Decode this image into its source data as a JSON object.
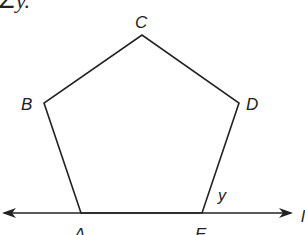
{
  "caption_fragment": "∠y.",
  "figure": {
    "type": "regular pentagon on a line",
    "vertices": {
      "A": {
        "label": "A",
        "x": 81,
        "y": 213
      },
      "B": {
        "label": "B",
        "x": 44,
        "y": 103
      },
      "C": {
        "label": "C",
        "x": 142,
        "y": 35
      },
      "D": {
        "label": "D",
        "x": 239,
        "y": 103
      },
      "E": {
        "label": "E",
        "x": 202,
        "y": 213
      }
    },
    "angle_label": "y",
    "line": {
      "x1": 2,
      "x2": 292,
      "y": 213,
      "arrows": "both",
      "right_label_partial": "l"
    },
    "stroke_color": "#222222"
  }
}
